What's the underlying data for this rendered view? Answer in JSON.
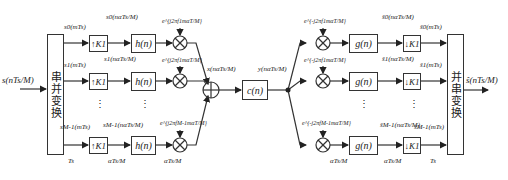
{
  "diagram": {
    "input": {
      "label": "s(nTs/M)"
    },
    "output": {
      "label": "ŝ(nTs/M)"
    },
    "sp_converter": {
      "label": "串并变换"
    },
    "ps_converter": {
      "label": "并串变换"
    },
    "tx_branches": [
      {
        "sub_in": "s0(mTs)",
        "upsampler": "↑K1",
        "sub_up": "s0(nαTs/M)",
        "filter": "h(n)",
        "mod": "e^{j2πf1mαT/M}"
      },
      {
        "sub_in": "s1(mTs)",
        "upsampler": "↑K1",
        "sub_up": "s1(nαTs/M)",
        "filter": "h(n)",
        "mod": "e^{j2πf1mαT/M}"
      },
      {
        "sub_in": "sM-1(mTs)",
        "upsampler": "↑K1",
        "sub_up": "sM-1(nαTs/M)",
        "filter": "h(n)",
        "mod": "e^{j2πfM-1mαT/M}"
      }
    ],
    "sum_output": "x(nαTs/M)",
    "channel": {
      "label": "c(n)"
    },
    "channel_output": "y(nαTs/M)",
    "rx_branches": [
      {
        "demod": "e^{-j2πf1mαT/M}",
        "filter": "g(n)",
        "sub_filt": "ŝ0(nαTs/M)",
        "downsampler": "↓K1",
        "sub_out": "ŝ0(mTs)"
      },
      {
        "demod": "e^{-j2πf1mαT/M}",
        "filter": "g(n)",
        "sub_filt": "ŝ1(nαTs/M)",
        "downsampler": "↓K1",
        "sub_out": "ŝ1(mTs)"
      },
      {
        "demod": "e^{-j2πfM-1mαT/M}",
        "filter": "g(n)",
        "sub_filt": "ŝM-1(nαTs/M)",
        "downsampler": "↓K1",
        "sub_out": "ŝM-1(mTs)"
      }
    ],
    "rate_labels": {
      "Ts_left": "Ts",
      "Ts_right": "Ts",
      "rate": "αTs/M"
    },
    "ellipsis": "⋮"
  }
}
